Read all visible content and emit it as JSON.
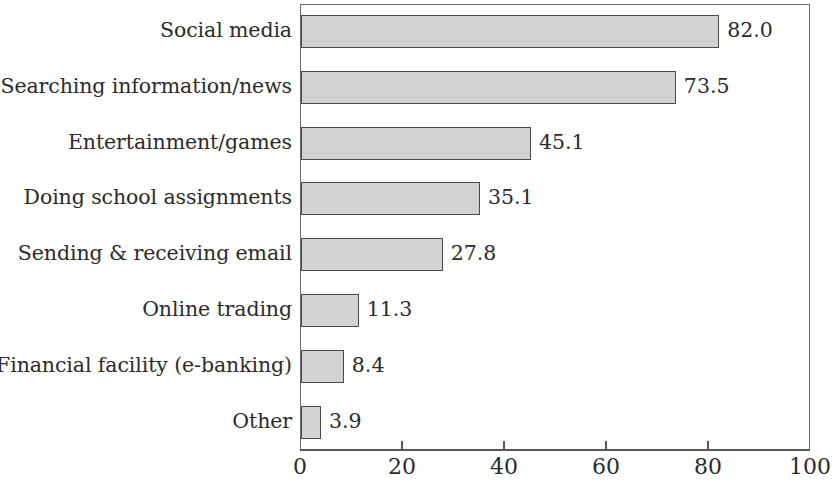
{
  "chart_data": {
    "type": "bar",
    "orientation": "horizontal",
    "title": "",
    "subtitle": "",
    "xlabel": "",
    "ylabel": "",
    "xlim": [
      0,
      100
    ],
    "xticks": [
      "0",
      "20",
      "40",
      "60",
      "80",
      "100"
    ],
    "xtick_values": [
      0,
      20,
      40,
      60,
      80,
      100
    ],
    "grid": false,
    "legend": false,
    "legend_position": "none",
    "frame": true,
    "categories": [
      "Social media",
      "Searching information/news",
      "Entertainment/games",
      "Doing school assignments",
      "Sending & receiving email",
      "Online trading",
      "Financial facility (e-banking)",
      "Other"
    ],
    "values": [
      82.0,
      73.5,
      45.1,
      35.1,
      27.8,
      11.3,
      8.4,
      3.9
    ],
    "value_labels": [
      "82.0",
      "73.5",
      "45.1",
      "35.1",
      "27.8",
      "11.3",
      "8.4",
      "3.9"
    ],
    "bar_fill_color": "#d2d2d2",
    "bar_edge_color": "#4a4a4a",
    "axis_color": "#585858",
    "text_color": "#2b2b2b",
    "background_color": "#ffffff"
  }
}
